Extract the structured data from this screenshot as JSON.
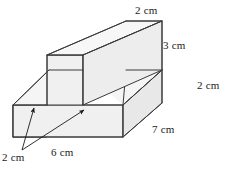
{
  "figure": {
    "shape": "t-shaped-prism",
    "projection": "oblique",
    "style": {
      "face_fill": "#f0f0f0",
      "face_fill_light": "#f5f5f5",
      "face_fill_dark": "#e8e8e8",
      "stroke": "#3a3a3a",
      "background": "#ffffff",
      "text_color": "#1a1a1a"
    },
    "labels": {
      "top_width": "2 cm",
      "stem_height": "3 cm",
      "base_height": "2 cm",
      "depth": "7 cm",
      "base_width": "6 cm",
      "base_thickness": "2 cm"
    },
    "measurements": [
      {
        "name": "top-width",
        "value": 2,
        "unit": "cm",
        "text": "2 cm",
        "edge": "top face front width"
      },
      {
        "name": "stem-height",
        "value": 3,
        "unit": "cm",
        "text": "3 cm",
        "edge": "vertical stem right edge"
      },
      {
        "name": "base-height",
        "value": 2,
        "unit": "cm",
        "text": "2 cm",
        "edge": "base right vertical edge"
      },
      {
        "name": "depth",
        "value": 7,
        "unit": "cm",
        "text": "7 cm",
        "edge": "base bottom receding edge"
      },
      {
        "name": "base-width",
        "value": 6,
        "unit": "cm",
        "text": "6 cm",
        "edge": "base front bottom edge"
      },
      {
        "name": "base-thickness",
        "value": 2,
        "unit": "cm",
        "text": "2 cm",
        "edge": "base front left thickness, two arrows"
      }
    ]
  }
}
